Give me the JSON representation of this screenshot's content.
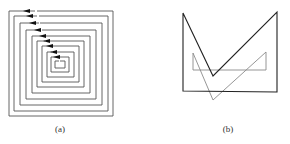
{
  "figures": [
    {
      "id": "a",
      "caption": "(a)",
      "description": "Square spiral of nested rectangles with left-pointing arrows on top edges",
      "stroke_color": "#555555",
      "arrow_color": "#111111"
    },
    {
      "id": "b",
      "caption": "(b)",
      "description": "Black V-shaped polygon overlapped by a smaller gray translated copy",
      "primary_color": "#222222",
      "secondary_color": "#8a8a8a"
    }
  ]
}
